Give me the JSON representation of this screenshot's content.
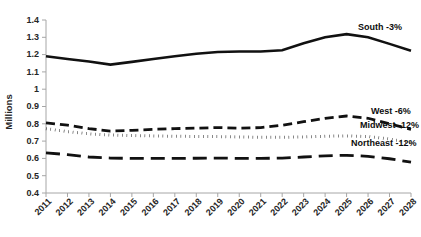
{
  "chart_data": {
    "type": "line",
    "title": "",
    "xlabel": "",
    "ylabel": "Millions",
    "ylim": [
      0.4,
      1.4
    ],
    "ytick_step": 0.1,
    "yticks": [
      "0.4",
      "0.5",
      "0.6",
      "0.7",
      "0.8",
      "0.9",
      "1",
      "1.1",
      "1.2",
      "1.3",
      "1.4"
    ],
    "grid": false,
    "legend_position": "inline-right-of-line-ends",
    "categories": [
      "2011",
      "2012",
      "2013",
      "2014",
      "2015",
      "2016",
      "2017",
      "2018",
      "2019",
      "2020",
      "2021",
      "2022",
      "2023",
      "2024",
      "2025",
      "2026",
      "2027",
      "2028"
    ],
    "series": [
      {
        "name": "South",
        "label": "South -3%",
        "change": "-3%",
        "style": "solid",
        "values": [
          1.19,
          1.175,
          1.16,
          1.142,
          1.158,
          1.175,
          1.19,
          1.205,
          1.215,
          1.218,
          1.218,
          1.225,
          1.265,
          1.3,
          1.318,
          1.3,
          1.262,
          1.222
        ]
      },
      {
        "name": "West",
        "label": "West -6%",
        "change": "-6%",
        "style": "dashed",
        "values": [
          0.805,
          0.792,
          0.772,
          0.758,
          0.762,
          0.768,
          0.772,
          0.775,
          0.778,
          0.775,
          0.778,
          0.792,
          0.812,
          0.832,
          0.845,
          0.832,
          0.8,
          0.768
        ]
      },
      {
        "name": "Midwest",
        "label": "Midwest -12%",
        "change": "-12%",
        "style": "dotted",
        "values": [
          0.772,
          0.755,
          0.742,
          0.735,
          0.732,
          0.73,
          0.728,
          0.727,
          0.726,
          0.724,
          0.722,
          0.722,
          0.724,
          0.728,
          0.73,
          0.726,
          0.712,
          0.69
        ]
      },
      {
        "name": "Northeast",
        "label": "Northeast -12%",
        "change": "-12%",
        "style": "longdash",
        "values": [
          0.632,
          0.622,
          0.608,
          0.602,
          0.6,
          0.6,
          0.6,
          0.601,
          0.602,
          0.6,
          0.6,
          0.602,
          0.608,
          0.615,
          0.618,
          0.612,
          0.598,
          0.578
        ]
      }
    ],
    "colors": {
      "line": "#111111",
      "axis": "#a6a6a6",
      "text": "#262626",
      "background": "#ffffff"
    }
  }
}
